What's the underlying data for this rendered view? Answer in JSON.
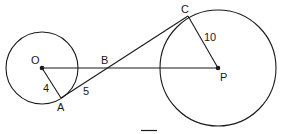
{
  "diagram": {
    "type": "geometry",
    "points": {
      "O": {
        "label": "O",
        "x": 42,
        "y": 68
      },
      "A": {
        "label": "A",
        "x": 61,
        "y": 98
      },
      "B": {
        "label": "B",
        "x": 109,
        "y": 68
      },
      "C": {
        "label": "C",
        "x": 188,
        "y": 16
      },
      "P": {
        "label": "P",
        "x": 218,
        "y": 68
      }
    },
    "circles": [
      {
        "center": "O",
        "radius_px": 36
      },
      {
        "center": "P",
        "radius_px": 58
      }
    ],
    "segments": [
      {
        "from": "O",
        "to": "P"
      },
      {
        "from": "O",
        "to": "A",
        "length_label": "4"
      },
      {
        "from": "A",
        "to": "C"
      },
      {
        "from": "P",
        "to": "C",
        "length_label": "10"
      }
    ],
    "length_labels": {
      "OA": "4",
      "AB": "5",
      "PC": "10"
    },
    "stroke_color": "#1a1a1a",
    "background": "#ffffff"
  }
}
